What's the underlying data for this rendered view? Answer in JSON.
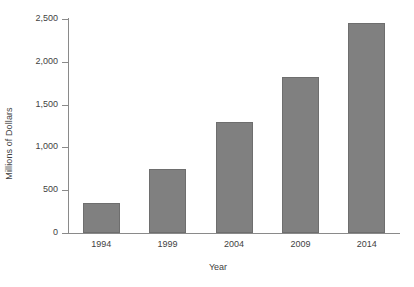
{
  "chart_data": {
    "type": "bar",
    "title": "",
    "xlabel": "Year",
    "ylabel": "Millions of Dollars",
    "categories": [
      "1994",
      "1999",
      "2004",
      "2009",
      "2014"
    ],
    "values": [
      350,
      750,
      1300,
      1820,
      2450
    ],
    "ylim": [
      0,
      2500
    ],
    "ytick_values": [
      0,
      500,
      1000,
      1500,
      2000,
      2500
    ],
    "ytick_labels": [
      "0",
      "500",
      "1,000",
      "1,500",
      "2,000",
      "2,500"
    ],
    "grid": false,
    "legend": null,
    "series": [
      {
        "name": "Millions of Dollars",
        "values": [
          350,
          750,
          1300,
          1820,
          2450
        ]
      }
    ],
    "colors": {
      "bar_fill": "#808080",
      "bar_edge": "#6e6e6e",
      "axis": "#8a8a8a",
      "text": "#3f3f3f",
      "background": "#ffffff"
    }
  }
}
